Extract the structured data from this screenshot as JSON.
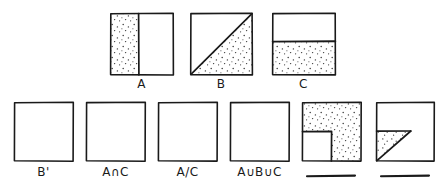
{
  "document": {
    "title": "Set operation Venn-style square diagrams (hand drawn worksheet)",
    "background_color": "#ffffff",
    "ink_color": "#1a1a1a",
    "stipple_color": "#3a3a3a"
  },
  "top_row": {
    "items": [
      {
        "id": "square-a",
        "label": "A",
        "shading": "left-vertical-band",
        "divider": "vertical",
        "divider_fraction": 0.45,
        "shaded_region": "left"
      },
      {
        "id": "square-b",
        "label": "B",
        "shading": "lower-right-triangle",
        "divider": "diagonal-bottomleft-to-topright",
        "divider_fraction": 1.0,
        "shaded_region": "below-diagonal"
      },
      {
        "id": "square-c",
        "label": "C",
        "shading": "bottom-horizontal-band",
        "divider": "horizontal",
        "divider_fraction": 0.45,
        "shaded_region": "bottom"
      }
    ]
  },
  "bottom_row": {
    "items": [
      {
        "id": "answer-b-complement",
        "label": "B'",
        "shading": "none",
        "answer_line": false
      },
      {
        "id": "answer-a-intersect-c",
        "label": "A∩C",
        "shading": "none",
        "answer_line": false
      },
      {
        "id": "answer-a-minus-c",
        "label": "A/C",
        "shading": "none",
        "answer_line": false
      },
      {
        "id": "answer-a-union-b-union-c",
        "label": "A∪B∪C",
        "shading": "none",
        "answer_line": false
      },
      {
        "id": "answer-blank-notched",
        "label": "",
        "shading": "all-except-bottom-left-rectangle",
        "answer_line": true
      },
      {
        "id": "answer-blank-triangle",
        "label": "",
        "shading": "small-lower-left-triangle",
        "answer_line": true
      }
    ]
  },
  "geometry": {
    "top_squares": [
      {
        "x": 110,
        "y": 13,
        "w": 63,
        "h": 62
      },
      {
        "x": 190,
        "y": 13,
        "w": 62,
        "h": 62
      },
      {
        "x": 272,
        "y": 13,
        "w": 63,
        "h": 62
      }
    ],
    "top_labels_y": 77,
    "bottom_squares": [
      {
        "x": 14,
        "y": 102,
        "w": 59,
        "h": 59
      },
      {
        "x": 86,
        "y": 102,
        "w": 59,
        "h": 59
      },
      {
        "x": 158,
        "y": 102,
        "w": 59,
        "h": 59
      },
      {
        "x": 230,
        "y": 102,
        "w": 59,
        "h": 59
      },
      {
        "x": 302,
        "y": 102,
        "w": 59,
        "h": 59
      },
      {
        "x": 376,
        "y": 102,
        "w": 58,
        "h": 59
      }
    ],
    "bottom_labels_y": 165,
    "answer_lines": [
      {
        "x": 307,
        "y": 176,
        "w": 48
      },
      {
        "x": 381,
        "y": 176,
        "w": 48
      }
    ]
  }
}
